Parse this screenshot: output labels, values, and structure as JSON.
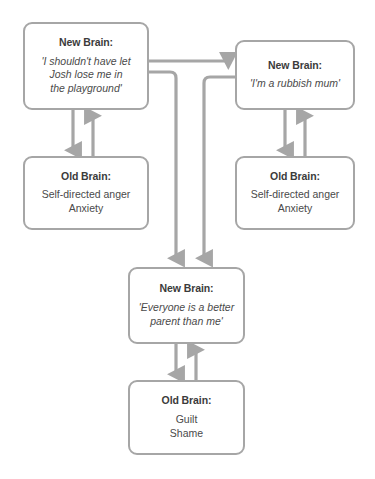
{
  "diagram": {
    "type": "flowchart",
    "title": "",
    "stroke_color": "#a6a6a6",
    "text_color": "#3b3b3b",
    "background_color": "#ffffff",
    "nodes": [
      {
        "id": "new-brain-1",
        "title": "New Brain:",
        "body": "'I shouldn't have let\nJosh lose me in\nthe playground'",
        "style": "quote"
      },
      {
        "id": "old-brain-1",
        "title": "Old Brain:",
        "body": "Self-directed anger\nAnxiety",
        "style": "plain"
      },
      {
        "id": "new-brain-2",
        "title": "New Brain:",
        "body": "'I'm a rubbish mum'",
        "style": "quote"
      },
      {
        "id": "old-brain-2",
        "title": "Old Brain:",
        "body": "Self-directed anger\nAnxiety",
        "style": "plain"
      },
      {
        "id": "new-brain-3",
        "title": "New Brain:",
        "body": "'Everyone is a better\nparent than me'",
        "style": "quote"
      },
      {
        "id": "old-brain-3",
        "title": "Old Brain:",
        "body": "Guilt\nShame",
        "style": "plain"
      }
    ],
    "edges": [
      {
        "from": "new-brain-1",
        "to": "old-brain-1",
        "direction": "down"
      },
      {
        "from": "old-brain-1",
        "to": "new-brain-1",
        "direction": "up"
      },
      {
        "from": "new-brain-1",
        "to": "new-brain-2",
        "direction": "right"
      },
      {
        "from": "new-brain-2",
        "to": "old-brain-2",
        "direction": "down"
      },
      {
        "from": "old-brain-2",
        "to": "new-brain-2",
        "direction": "up"
      },
      {
        "from": "new-brain-1",
        "to": "new-brain-3",
        "direction": "down"
      },
      {
        "from": "new-brain-2",
        "to": "new-brain-3",
        "direction": "down"
      },
      {
        "from": "new-brain-3",
        "to": "old-brain-3",
        "direction": "down"
      },
      {
        "from": "old-brain-3",
        "to": "new-brain-3",
        "direction": "up"
      }
    ]
  }
}
